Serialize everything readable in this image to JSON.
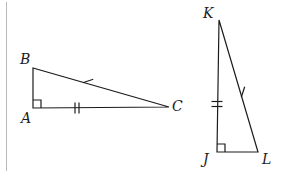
{
  "figure": {
    "type": "geometry-diagram",
    "background_color": "#ffffff",
    "stroke_color": "#1c1c1c",
    "label_color": "#1c1c1c",
    "border_color": "#b9b9b9",
    "width": 285,
    "height": 173
  },
  "left_border": {
    "name": "left-rule",
    "x": 6.5,
    "y1": 2,
    "y2": 171,
    "color": "#b9b9b9",
    "width": 1
  },
  "triangles": [
    {
      "id": "ABC",
      "name": "triangle-abc",
      "vertices": [
        {
          "label": "B",
          "x": 33,
          "y": 68,
          "label_x": 20,
          "label_y": 52
        },
        {
          "label": "A",
          "x": 33,
          "y": 108,
          "label_x": 21,
          "label_y": 111
        },
        {
          "label": "C",
          "x": 169,
          "y": 107,
          "label_x": 172,
          "label_y": 99
        }
      ],
      "right_angle_at": "A",
      "right_angle_marker": {
        "x": 33,
        "y": 108,
        "size": 8,
        "dir_x": 1,
        "dir_y": -1
      },
      "ticks": [
        {
          "on": "BC",
          "count": 1,
          "x": 88,
          "y": 81,
          "angle": 72,
          "len": 11,
          "gap": 0
        },
        {
          "on": "AC",
          "count": 2,
          "x": 77,
          "y": 108,
          "angle": 0,
          "len": 11,
          "gap": 4
        }
      ]
    },
    {
      "id": "JKL",
      "name": "triangle-jkl",
      "vertices": [
        {
          "label": "K",
          "x": 219,
          "y": 20,
          "label_x": 203,
          "label_y": 6
        },
        {
          "label": "J",
          "x": 217,
          "y": 152,
          "label_x": 203,
          "label_y": 152
        },
        {
          "label": "L",
          "x": 258,
          "y": 152,
          "label_x": 262,
          "label_y": 152
        }
      ],
      "right_angle_at": "J",
      "right_angle_marker": {
        "x": 217,
        "y": 152,
        "size": 8,
        "dir_x": 1,
        "dir_y": -1
      },
      "ticks": [
        {
          "on": "JK",
          "count": 2,
          "x": 217,
          "y": 104,
          "angle": 90,
          "len": 11,
          "gap": 5
        },
        {
          "on": "KL",
          "count": 1,
          "x": 243,
          "y": 92,
          "angle": 18,
          "len": 11,
          "gap": 0
        }
      ]
    }
  ]
}
